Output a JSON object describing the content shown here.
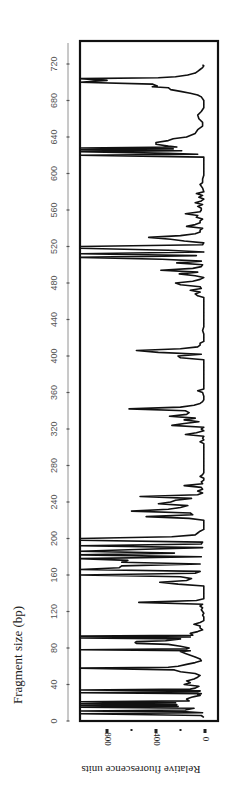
{
  "chart_data": {
    "type": "line",
    "orientation": "rotated-90",
    "title": "",
    "xlabel": "Fragment size (bp)",
    "ylabel": "Relative fluorescence units",
    "xlim": [
      0,
      740
    ],
    "ylim": [
      0,
      1020
    ],
    "x_ticks": [
      0,
      40,
      80,
      120,
      160,
      200,
      240,
      280,
      320,
      360,
      400,
      440,
      480,
      520,
      560,
      600,
      640,
      680,
      720
    ],
    "x_tick_labels": [
      "0",
      "40",
      "80",
      "120",
      "160",
      "200",
      "240",
      "280",
      "320",
      "360",
      "400",
      "440",
      "480",
      "520",
      "560",
      "600",
      "640",
      "680",
      "720"
    ],
    "y_ticks": [
      0,
      200,
      400,
      600,
      800
    ],
    "y_tick_labels": [
      "0",
      "",
      "400",
      "",
      "800"
    ],
    "grid": false,
    "legend": "none",
    "series": [
      {
        "name": "electropherogram",
        "points": [
          [
            4,
            10
          ],
          [
            6,
            30
          ],
          [
            8,
            1020
          ],
          [
            9,
            20
          ],
          [
            10,
            150
          ],
          [
            11,
            1020
          ],
          [
            12,
            160
          ],
          [
            14,
            90
          ],
          [
            15,
            1020
          ],
          [
            16,
            220
          ],
          [
            17,
            1020
          ],
          [
            18,
            230
          ],
          [
            19,
            1020
          ],
          [
            20,
            240
          ],
          [
            21,
            1020
          ],
          [
            22,
            130
          ],
          [
            24,
            150
          ],
          [
            26,
            110
          ],
          [
            27,
            80
          ],
          [
            28,
            40
          ],
          [
            29,
            60
          ],
          [
            30,
            30
          ],
          [
            31,
            1020
          ],
          [
            32,
            60
          ],
          [
            33,
            40
          ],
          [
            34,
            1020
          ],
          [
            35,
            120
          ],
          [
            36,
            80
          ],
          [
            38,
            50
          ],
          [
            40,
            170
          ],
          [
            42,
            120
          ],
          [
            44,
            150
          ],
          [
            46,
            90
          ],
          [
            48,
            60
          ],
          [
            50,
            40
          ],
          [
            52,
            80
          ],
          [
            54,
            200
          ],
          [
            56,
            250
          ],
          [
            58,
            1020
          ],
          [
            59,
            300
          ],
          [
            60,
            220
          ],
          [
            62,
            150
          ],
          [
            64,
            80
          ],
          [
            66,
            30
          ],
          [
            68,
            40
          ],
          [
            70,
            80
          ],
          [
            72,
            120
          ],
          [
            74,
            160
          ],
          [
            76,
            200
          ],
          [
            77,
            120
          ],
          [
            78,
            1020
          ],
          [
            79,
            150
          ],
          [
            80,
            130
          ],
          [
            82,
            200
          ],
          [
            84,
            300
          ],
          [
            85,
            560
          ],
          [
            86,
            570
          ],
          [
            87,
            560
          ],
          [
            88,
            320
          ],
          [
            90,
            200
          ],
          [
            91,
            1020
          ],
          [
            92,
            120
          ],
          [
            93,
            1020
          ],
          [
            94,
            100
          ],
          [
            96,
            120
          ],
          [
            98,
            60
          ],
          [
            100,
            20
          ],
          [
            102,
            40
          ],
          [
            104,
            40
          ],
          [
            106,
            90
          ],
          [
            108,
            40
          ],
          [
            110,
            10
          ],
          [
            112,
            10
          ],
          [
            114,
            10
          ],
          [
            116,
            20
          ],
          [
            118,
            10
          ],
          [
            120,
            20
          ],
          [
            122,
            30
          ],
          [
            124,
            20
          ],
          [
            126,
            40
          ],
          [
            128,
            20
          ],
          [
            130,
            540
          ],
          [
            132,
            70
          ],
          [
            134,
            10
          ],
          [
            136,
            10
          ],
          [
            140,
            10
          ],
          [
            144,
            10
          ],
          [
            148,
            10
          ],
          [
            150,
            220
          ],
          [
            152,
            370
          ],
          [
            154,
            150
          ],
          [
            156,
            110
          ],
          [
            158,
            200
          ],
          [
            160,
            1020
          ],
          [
            162,
            80
          ],
          [
            164,
            40
          ],
          [
            166,
            1020
          ],
          [
            168,
            700
          ],
          [
            170,
            680
          ],
          [
            172,
            40
          ],
          [
            174,
            680
          ],
          [
            176,
            630
          ],
          [
            178,
            1020
          ],
          [
            180,
            30
          ],
          [
            182,
            1020
          ],
          [
            184,
            250
          ],
          [
            186,
            1020
          ],
          [
            188,
            560
          ],
          [
            190,
            20
          ],
          [
            192,
            1020
          ],
          [
            194,
            30
          ],
          [
            196,
            20
          ],
          [
            198,
            1020
          ],
          [
            200,
            1020
          ],
          [
            202,
            270
          ],
          [
            204,
            80
          ],
          [
            206,
            60
          ],
          [
            208,
            40
          ],
          [
            210,
            10
          ],
          [
            214,
            10
          ],
          [
            218,
            10
          ],
          [
            220,
            10
          ],
          [
            222,
            130
          ],
          [
            224,
            480
          ],
          [
            226,
            100
          ],
          [
            228,
            120
          ],
          [
            230,
            600
          ],
          [
            232,
            300
          ],
          [
            234,
            200
          ],
          [
            236,
            140
          ],
          [
            238,
            380
          ],
          [
            240,
            280
          ],
          [
            242,
            240
          ],
          [
            244,
            110
          ],
          [
            246,
            530
          ],
          [
            248,
            60
          ],
          [
            250,
            20
          ],
          [
            252,
            60
          ],
          [
            254,
            20
          ],
          [
            256,
            30
          ],
          [
            258,
            170
          ],
          [
            260,
            20
          ],
          [
            262,
            30
          ],
          [
            264,
            10
          ],
          [
            266,
            10
          ],
          [
            268,
            40
          ],
          [
            270,
            20
          ],
          [
            272,
            10
          ],
          [
            276,
            10
          ],
          [
            280,
            10
          ],
          [
            284,
            10
          ],
          [
            288,
            10
          ],
          [
            292,
            10
          ],
          [
            296,
            10
          ],
          [
            300,
            10
          ],
          [
            304,
            10
          ],
          [
            306,
            40
          ],
          [
            308,
            10
          ],
          [
            310,
            20
          ],
          [
            312,
            10
          ],
          [
            314,
            160
          ],
          [
            316,
            70
          ],
          [
            318,
            10
          ],
          [
            320,
            30
          ],
          [
            322,
            10
          ],
          [
            324,
            270
          ],
          [
            326,
            170
          ],
          [
            328,
            50
          ],
          [
            330,
            170
          ],
          [
            332,
            80
          ],
          [
            334,
            290
          ],
          [
            336,
            150
          ],
          [
            338,
            130
          ],
          [
            340,
            160
          ],
          [
            342,
            620
          ],
          [
            344,
            200
          ],
          [
            346,
            90
          ],
          [
            348,
            40
          ],
          [
            350,
            20
          ],
          [
            352,
            10
          ],
          [
            356,
            10
          ],
          [
            360,
            20
          ],
          [
            362,
            60
          ],
          [
            364,
            10
          ],
          [
            368,
            10
          ],
          [
            372,
            10
          ],
          [
            376,
            10
          ],
          [
            380,
            10
          ],
          [
            384,
            10
          ],
          [
            388,
            10
          ],
          [
            392,
            10
          ],
          [
            396,
            10
          ],
          [
            398,
            200
          ],
          [
            400,
            220
          ],
          [
            402,
            30
          ],
          [
            404,
            380
          ],
          [
            406,
            560
          ],
          [
            408,
            200
          ],
          [
            410,
            60
          ],
          [
            412,
            40
          ],
          [
            414,
            40
          ],
          [
            416,
            10
          ],
          [
            420,
            10
          ],
          [
            424,
            10
          ],
          [
            428,
            20
          ],
          [
            432,
            10
          ],
          [
            436,
            10
          ],
          [
            440,
            10
          ],
          [
            444,
            10
          ],
          [
            448,
            10
          ],
          [
            452,
            10
          ],
          [
            456,
            10
          ],
          [
            460,
            10
          ],
          [
            464,
            10
          ],
          [
            466,
            60
          ],
          [
            468,
            80
          ],
          [
            470,
            40
          ],
          [
            472,
            120
          ],
          [
            474,
            30
          ],
          [
            476,
            40
          ],
          [
            478,
            200
          ],
          [
            480,
            240
          ],
          [
            482,
            100
          ],
          [
            484,
            40
          ],
          [
            486,
            10
          ],
          [
            488,
            80
          ],
          [
            490,
            210
          ],
          [
            492,
            60
          ],
          [
            494,
            360
          ],
          [
            496,
            100
          ],
          [
            498,
            30
          ],
          [
            500,
            20
          ],
          [
            502,
            230
          ],
          [
            504,
            30
          ],
          [
            506,
            350
          ],
          [
            508,
            1020
          ],
          [
            510,
            70
          ],
          [
            512,
            1020
          ],
          [
            514,
            10
          ],
          [
            516,
            300
          ],
          [
            518,
            1020
          ],
          [
            520,
            1020
          ],
          [
            522,
            20
          ],
          [
            524,
            10
          ],
          [
            526,
            170
          ],
          [
            528,
            280
          ],
          [
            530,
            460
          ],
          [
            532,
            200
          ],
          [
            534,
            80
          ],
          [
            536,
            40
          ],
          [
            538,
            40
          ],
          [
            540,
            20
          ],
          [
            542,
            150
          ],
          [
            544,
            80
          ],
          [
            546,
            40
          ],
          [
            548,
            40
          ],
          [
            550,
            20
          ],
          [
            552,
            70
          ],
          [
            554,
            60
          ],
          [
            556,
            160
          ],
          [
            558,
            40
          ],
          [
            560,
            30
          ],
          [
            562,
            30
          ],
          [
            564,
            60
          ],
          [
            566,
            20
          ],
          [
            568,
            80
          ],
          [
            570,
            30
          ],
          [
            572,
            10
          ],
          [
            574,
            50
          ],
          [
            576,
            20
          ],
          [
            578,
            70
          ],
          [
            580,
            10
          ],
          [
            584,
            20
          ],
          [
            588,
            40
          ],
          [
            590,
            20
          ],
          [
            594,
            20
          ],
          [
            598,
            10
          ],
          [
            602,
            10
          ],
          [
            606,
            10
          ],
          [
            610,
            10
          ],
          [
            614,
            10
          ],
          [
            618,
            10
          ],
          [
            620,
            1020
          ],
          [
            621,
            60
          ],
          [
            622,
            300
          ],
          [
            624,
            1020
          ],
          [
            625,
            190
          ],
          [
            626,
            1020
          ],
          [
            627,
            260
          ],
          [
            628,
            1020
          ],
          [
            629,
            230
          ],
          [
            630,
            300
          ],
          [
            632,
            400
          ],
          [
            634,
            400
          ],
          [
            636,
            300
          ],
          [
            638,
            260
          ],
          [
            640,
            150
          ],
          [
            644,
            80
          ],
          [
            648,
            60
          ],
          [
            652,
            20
          ],
          [
            656,
            20
          ],
          [
            660,
            50
          ],
          [
            664,
            60
          ],
          [
            668,
            30
          ],
          [
            672,
            10
          ],
          [
            676,
            10
          ],
          [
            680,
            10
          ],
          [
            684,
            30
          ],
          [
            686,
            60
          ],
          [
            688,
            120
          ],
          [
            690,
            200
          ],
          [
            692,
            280
          ],
          [
            694,
            300
          ],
          [
            695,
            430
          ],
          [
            696,
            390
          ],
          [
            698,
            430
          ],
          [
            700,
            1020
          ],
          [
            702,
            800
          ],
          [
            704,
            1020
          ],
          [
            705,
            380
          ],
          [
            706,
            240
          ],
          [
            708,
            140
          ],
          [
            710,
            80
          ],
          [
            712,
            60
          ],
          [
            714,
            40
          ],
          [
            716,
            20
          ],
          [
            718,
            10
          ],
          [
            719,
            20
          ]
        ]
      }
    ]
  }
}
